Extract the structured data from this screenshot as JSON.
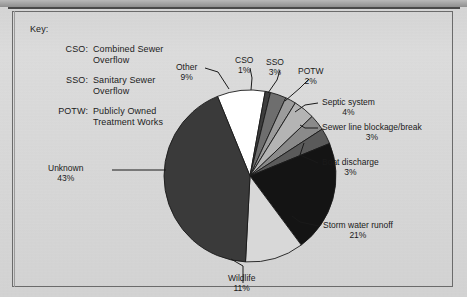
{
  "figure": {
    "key_title": "Key:",
    "key_items": [
      {
        "abbr": "CSO:",
        "line1": "Combined Sewer",
        "line2": "Overflow"
      },
      {
        "abbr": "SSO:",
        "line1": "Sanitary Sewer",
        "line2": "Overflow"
      },
      {
        "abbr": "POTW:",
        "line1": "Publicly Owned",
        "line2": "Treatment Works"
      }
    ]
  },
  "chart_data": {
    "type": "pie",
    "title": "",
    "xlabel": "",
    "ylabel": "",
    "legend_position": "none",
    "grid": false,
    "units": "percent",
    "total": 100,
    "categories": [
      "Unknown",
      "Storm water runoff",
      "Wildlife",
      "Other",
      "Septic system",
      "SSO",
      "Sewer line blockage/break",
      "Boat discharge",
      "POTW",
      "CSO"
    ],
    "values": [
      43,
      21,
      11,
      9,
      4,
      3,
      3,
      3,
      2,
      1
    ],
    "slices": [
      {
        "label": "Other",
        "pct": 9,
        "pct_text": "9%",
        "color": "#ffffff"
      },
      {
        "label": "CSO",
        "pct": 1,
        "pct_text": "1%",
        "color": "#3d3d3d"
      },
      {
        "label": "SSO",
        "pct": 3,
        "pct_text": "3%",
        "color": "#6e6e6e"
      },
      {
        "label": "POTW",
        "pct": 2,
        "pct_text": "2%",
        "color": "#9c9c9c"
      },
      {
        "label": "Septic system",
        "pct": 4,
        "pct_text": "4%",
        "color": "#b4b4b4"
      },
      {
        "label": "Sewer line blockage/break",
        "pct": 3,
        "pct_text": "3%",
        "color": "#8a8a8a"
      },
      {
        "label": "Boat discharge",
        "pct": 3,
        "pct_text": "3%",
        "color": "#5a5a5a"
      },
      {
        "label": "Storm water runoff",
        "pct": 21,
        "pct_text": "21%",
        "color": "#141414"
      },
      {
        "label": "Wildlife",
        "pct": 11,
        "pct_text": "11%",
        "color": "#d8d8d8"
      },
      {
        "label": "Unknown",
        "pct": 43,
        "pct_text": "43%",
        "color": "#3a3a3a"
      }
    ],
    "labels": {
      "other": {
        "name": "Other",
        "pct": "9%"
      },
      "cso": {
        "name": "CSO",
        "pct": "1%"
      },
      "sso": {
        "name": "SSO",
        "pct": "3%"
      },
      "potw": {
        "name": "POTW",
        "pct": "2%"
      },
      "septic": {
        "name": "Septic system",
        "pct": "4%"
      },
      "sewer": {
        "name": "Sewer line blockage/break",
        "pct": "3%"
      },
      "boat": {
        "name": "Boat discharge",
        "pct": "3%"
      },
      "storm": {
        "name": "Storm water runoff",
        "pct": "21%"
      },
      "wildlife": {
        "name": "Wildlife",
        "pct": "11%"
      },
      "unknown": {
        "name": "Unknown",
        "pct": "43%"
      }
    }
  }
}
